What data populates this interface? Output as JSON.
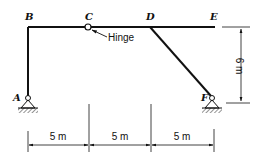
{
  "diagram": {
    "type": "structural-frame",
    "nodes": {
      "A": {
        "label": "A",
        "support": "pin"
      },
      "B": {
        "label": "B"
      },
      "C": {
        "label": "C",
        "connection": "hinge"
      },
      "D": {
        "label": "D"
      },
      "E": {
        "label": "E"
      },
      "F": {
        "label": "F",
        "support": "pin"
      }
    },
    "annotations": {
      "hinge": "Hinge"
    },
    "dimensions": {
      "span_ab_c": "5 m",
      "span_c_d": "5 m",
      "span_d_f": "5 m",
      "height": "6 m"
    },
    "colors": {
      "line": "#111111",
      "background": "#ffffff"
    }
  }
}
